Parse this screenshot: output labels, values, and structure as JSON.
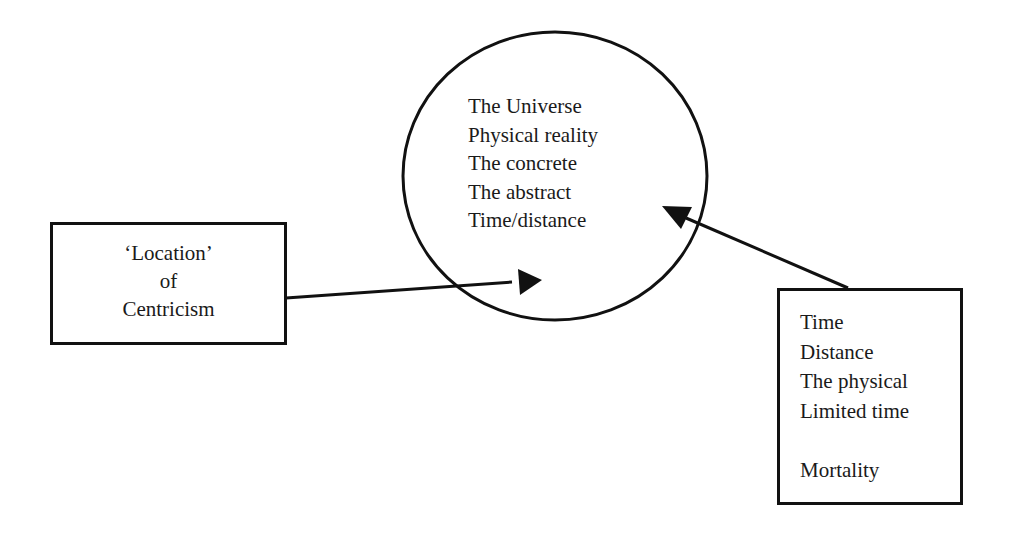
{
  "diagram": {
    "center_circle": {
      "items": [
        "The Universe",
        "Physical reality",
        "The concrete",
        "The abstract",
        "Time/distance"
      ]
    },
    "left_box": {
      "lines": [
        "‘Location’",
        "of",
        "Centricism"
      ]
    },
    "right_box": {
      "items": [
        "Time",
        "Distance",
        "The physical",
        "Limited time",
        "",
        "Mortality"
      ]
    },
    "arrows": [
      {
        "from": "left_box",
        "to": "center_circle"
      },
      {
        "from": "right_box",
        "to": "center_circle"
      }
    ],
    "colors": {
      "stroke": "#111111",
      "background": "#ffffff"
    }
  }
}
